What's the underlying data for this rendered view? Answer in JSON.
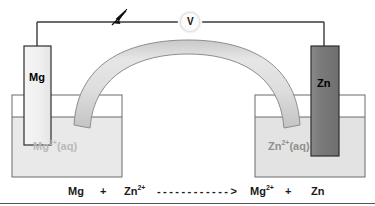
{
  "diagram": {
    "meter": {
      "name": "voltmeter",
      "label": "V"
    },
    "left_cell": {
      "electrode_label": "Mg",
      "solution_label_base": "Mg",
      "solution_label_charge": "2+",
      "solution_label_state": "(aq)",
      "electrode_color": "#f2f2f2",
      "solution_color": "#e9e9e9"
    },
    "right_cell": {
      "electrode_label": "Zn",
      "solution_label_base": "Zn",
      "solution_label_charge": "2+",
      "solution_label_state": "(aq)",
      "electrode_color": "#7d7d7d",
      "solution_color": "#e3e3e3"
    },
    "salt_bridge": {
      "name": "salt-bridge",
      "color": "#dcdcdc"
    },
    "electron_flow": {
      "name": "electron-flow-arrow",
      "direction": "left-to-right"
    },
    "equation": {
      "reactant_1": "Mg",
      "plus_1": "+",
      "reactant_2_base": "Zn",
      "reactant_2_charge": "2+",
      "arrow": "- - - - - - - - - - - - >",
      "product_1_base": "Mg",
      "product_1_charge": "2+",
      "plus_2": "+",
      "product_2": "Zn"
    },
    "colors": {
      "outline": "#4a4a4a",
      "wire": "#3a3a3a",
      "text": "#111111"
    }
  }
}
